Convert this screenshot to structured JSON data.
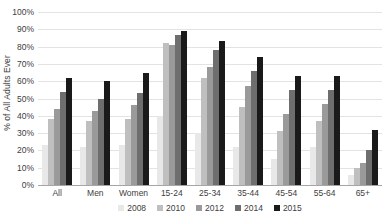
{
  "chart_data": {
    "type": "bar",
    "title": "",
    "subtitle": "",
    "xlabel": "",
    "ylabel": "% of All Adults Ever",
    "ylim": [
      0,
      100
    ],
    "y_ticks": [
      0,
      10,
      20,
      30,
      40,
      50,
      60,
      70,
      80,
      90,
      100
    ],
    "y_tick_labels": [
      "0%",
      "10%",
      "20%",
      "30%",
      "40%",
      "50%",
      "60%",
      "70%",
      "80%",
      "90%",
      "100%"
    ],
    "grid": true,
    "legend_position": "bottom",
    "categories": [
      "All",
      "Men",
      "Women",
      "15-24",
      "25-34",
      "35-44",
      "45-54",
      "55-64",
      "65+"
    ],
    "series": [
      {
        "name": "2008",
        "color": "#e8e8e8",
        "values": [
          23,
          22,
          23,
          40,
          30,
          22,
          15,
          22,
          6
        ]
      },
      {
        "name": "2010",
        "color": "#bfbfbf",
        "values": [
          38,
          37,
          38,
          82,
          62,
          45,
          31,
          37,
          10
        ]
      },
      {
        "name": "2012",
        "color": "#9a9a9a",
        "values": [
          44,
          43,
          46,
          81,
          68,
          57,
          41,
          47,
          13
        ]
      },
      {
        "name": "2014",
        "color": "#6e6e6e",
        "values": [
          54,
          50,
          53,
          87,
          78,
          66,
          55,
          55,
          20
        ]
      },
      {
        "name": "2015",
        "color": "#1a1a1a",
        "values": [
          62,
          60,
          65,
          89,
          83,
          74,
          63,
          63,
          32
        ]
      }
    ]
  }
}
